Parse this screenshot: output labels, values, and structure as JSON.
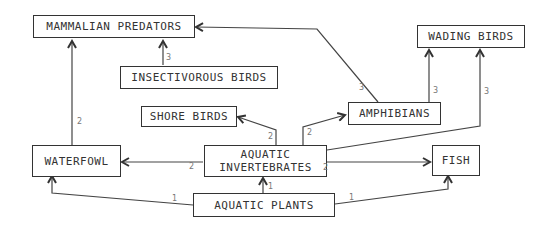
{
  "nodes": {
    "mammalian_predators": "MAMMALIAN PREDATORS",
    "wading_birds": "WADING BIRDS",
    "insectivorous_birds": "INSECTIVOROUS BIRDS",
    "shore_birds": "SHORE BIRDS",
    "amphibians": "AMPHIBIANS",
    "waterfowl": "WATERFOWL",
    "aquatic_invertebrates": "AQUATIC INVERTEBRATES",
    "fish": "FISH",
    "aquatic_plants": "AQUATIC PLANTS"
  },
  "edges": [
    {
      "from": "AQUATIC PLANTS",
      "to": "WATERFOWL",
      "label": "1"
    },
    {
      "from": "AQUATIC PLANTS",
      "to": "AQUATIC INVERTEBRATES",
      "label": "1"
    },
    {
      "from": "AQUATIC PLANTS",
      "to": "FISH",
      "label": "1"
    },
    {
      "from": "AQUATIC INVERTEBRATES",
      "to": "WATERFOWL",
      "label": "2"
    },
    {
      "from": "AQUATIC INVERTEBRATES",
      "to": "FISH",
      "label": "2"
    },
    {
      "from": "AQUATIC INVERTEBRATES",
      "to": "SHORE BIRDS",
      "label": "2"
    },
    {
      "from": "AQUATIC INVERTEBRATES",
      "to": "AMPHIBIANS",
      "label": "2"
    },
    {
      "from": "AQUATIC INVERTEBRATES",
      "to": "WADING BIRDS",
      "label": "3"
    },
    {
      "from": "WATERFOWL",
      "to": "MAMMALIAN PREDATORS",
      "label": "2"
    },
    {
      "from": "INSECTIVOROUS BIRDS",
      "to": "MAMMALIAN PREDATORS",
      "label": "3"
    },
    {
      "from": "AMPHIBIANS",
      "to": "MAMMALIAN PREDATORS",
      "label": "3"
    },
    {
      "from": "AMPHIBIANS",
      "to": "WADING BIRDS",
      "label": "3"
    }
  ],
  "edge_labels": {
    "plants_waterfowl": "1",
    "plants_invert": "1",
    "plants_fish": "1",
    "invert_waterfowl": "2",
    "invert_fish": "2",
    "invert_shore": "2",
    "invert_amph": "2",
    "invert_wading": "3",
    "waterfowl_mammal": "2",
    "insect_mammal": "3",
    "amph_mammal": "3",
    "amph_wading": "3"
  }
}
